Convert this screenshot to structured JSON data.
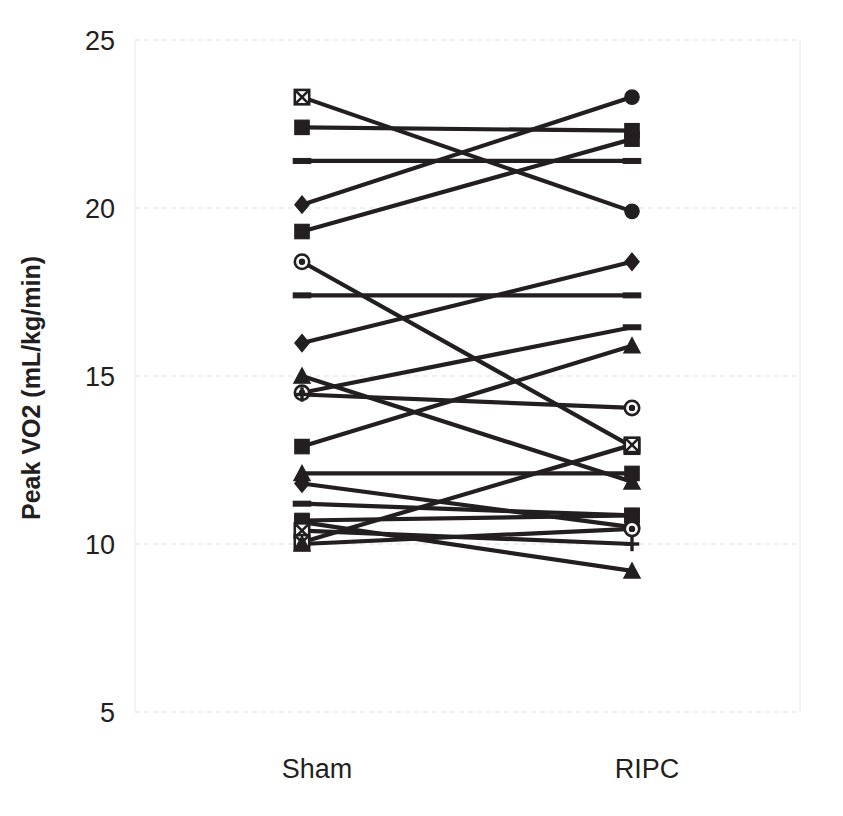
{
  "chart_data": {
    "type": "line",
    "subtype": "slope-chart-paired",
    "title": "",
    "xlabel": "",
    "ylabel": "Peak VO2 (mL/kg/min)",
    "categories": [
      "Sham",
      "RIPC"
    ],
    "x_tick_labels": [
      "Sham",
      "RIPC"
    ],
    "y_tick_labels": [
      "5",
      "10",
      "15",
      "20",
      "25"
    ],
    "y_ticks": [
      5,
      10,
      15,
      20,
      25
    ],
    "ylim": [
      5,
      25
    ],
    "grid": true,
    "grid_axis": "y",
    "legend": "none",
    "series_color": "#231f20",
    "pairs": [
      {
        "id": 1,
        "sham": 23.3,
        "ripc": 19.9,
        "marker_sham": "square-x",
        "marker_ripc": "circle-filled"
      },
      {
        "id": 2,
        "sham": 22.4,
        "ripc": 22.3,
        "marker_sham": "square-filled",
        "marker_ripc": "square-filled"
      },
      {
        "id": 3,
        "sham": 21.4,
        "ripc": 21.4,
        "marker_sham": "dash",
        "marker_ripc": "dash"
      },
      {
        "id": 4,
        "sham": 20.1,
        "ripc": 23.3,
        "marker_sham": "diamond",
        "marker_ripc": "circle-filled"
      },
      {
        "id": 5,
        "sham": 19.3,
        "ripc": 22.05,
        "marker_sham": "square-filled",
        "marker_ripc": "square-filled"
      },
      {
        "id": 6,
        "sham": 18.4,
        "ripc": 12.9,
        "marker_sham": "circle-open",
        "marker_ripc": "square-x"
      },
      {
        "id": 7,
        "sham": 17.4,
        "ripc": 17.4,
        "marker_sham": "dash",
        "marker_ripc": "dash"
      },
      {
        "id": 8,
        "sham": 15.98,
        "ripc": 18.4,
        "marker_sham": "diamond",
        "marker_ripc": "diamond"
      },
      {
        "id": 9,
        "sham": 15.0,
        "ripc": 11.85,
        "marker_sham": "triangle",
        "marker_ripc": "triangle"
      },
      {
        "id": 10,
        "sham": 14.5,
        "ripc": 16.45,
        "marker_sham": "circle-open",
        "marker_ripc": "dash"
      },
      {
        "id": 11,
        "sham": 14.45,
        "ripc": 14.05,
        "marker_sham": "plus",
        "marker_ripc": "circle-open"
      },
      {
        "id": 12,
        "sham": 12.9,
        "ripc": 15.9,
        "marker_sham": "square-filled",
        "marker_ripc": "triangle"
      },
      {
        "id": 13,
        "sham": 12.1,
        "ripc": 12.1,
        "marker_sham": "triangle",
        "marker_ripc": "square-filled"
      },
      {
        "id": 14,
        "sham": 11.8,
        "ripc": 10.5,
        "marker_sham": "diamond",
        "marker_ripc": "circle-open"
      },
      {
        "id": 15,
        "sham": 11.2,
        "ripc": 10.85,
        "marker_sham": "dash",
        "marker_ripc": "square-filled"
      },
      {
        "id": 16,
        "sham": 10.7,
        "ripc": 10.85,
        "marker_sham": "square-filled",
        "marker_ripc": "square-filled"
      },
      {
        "id": 17,
        "sham": 10.65,
        "ripc": 9.2,
        "marker_sham": "square-filled",
        "marker_ripc": "triangle"
      },
      {
        "id": 18,
        "sham": 10.4,
        "ripc": 10.0,
        "marker_sham": "square-x",
        "marker_ripc": "plus"
      },
      {
        "id": 19,
        "sham": 10.05,
        "ripc": 12.95,
        "marker_sham": "square-x",
        "marker_ripc": "square-x"
      },
      {
        "id": 20,
        "sham": 10.0,
        "ripc": 10.45,
        "marker_sham": "triangle",
        "marker_ripc": "circle-open"
      }
    ]
  }
}
